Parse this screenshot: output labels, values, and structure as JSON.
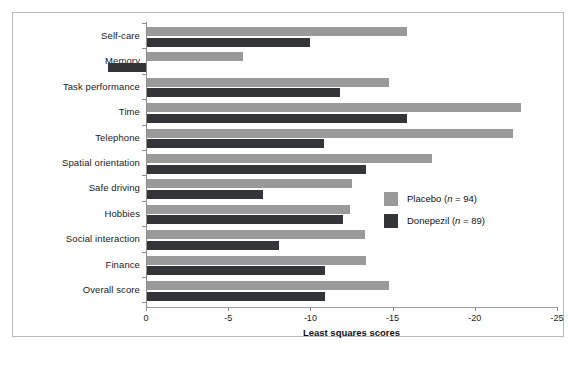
{
  "chart_data": {
    "type": "bar",
    "orientation": "horizontal",
    "title": "",
    "xlabel": "Least squares scores",
    "ylabel": "",
    "xlim": [
      0,
      -25
    ],
    "xticks": [
      "0",
      "-5",
      "-10",
      "-15",
      "-20",
      "-25"
    ],
    "xtick_values": [
      0,
      -5,
      -10,
      -15,
      -20,
      -25
    ],
    "grid": false,
    "legend_position": "right-middle",
    "categories": [
      "Self-care",
      "Memory",
      "Task performance",
      "Time",
      "Telephone",
      "Spatial orientation",
      "Safe driving",
      "Hobbies",
      "Social interaction",
      "Finance",
      "Overall score"
    ],
    "series": [
      {
        "name": "Placebo (n = 94)",
        "label": "Placebo",
        "n": 94,
        "color": "#9a9a9a",
        "values": [
          -15.9,
          -5.9,
          -14.8,
          -22.8,
          -22.3,
          -17.4,
          -12.5,
          -12.4,
          -13.3,
          -13.4,
          -14.8
        ]
      },
      {
        "name": "Donepezil (n = 89)",
        "label": "Donepezil",
        "n": 89,
        "color": "#333638",
        "values": [
          -10.0,
          2.3,
          -11.8,
          -15.9,
          -10.8,
          -13.4,
          -7.1,
          -12.0,
          -8.1,
          -10.9,
          -10.9
        ]
      }
    ]
  },
  "legend": {
    "entries": [
      {
        "label": "Placebo (n = 94)",
        "color": "#9a9a9a"
      },
      {
        "label": "Donepezil (n = 89)",
        "color": "#333638"
      }
    ]
  },
  "colors": {
    "placebo": "#9a9a9a",
    "donepezil": "#333638",
    "axis": "#8e8e8e",
    "frame": "#b9b9b9",
    "text": "#1a1a1a",
    "background": "#ffffff"
  }
}
